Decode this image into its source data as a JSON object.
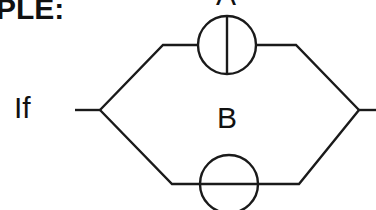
{
  "heading": {
    "text": "PLE:"
  },
  "labels": {
    "current": "If",
    "top_element": "A",
    "bottom_element": "B"
  },
  "colors": {
    "stroke": "#1a1a1a",
    "text": "#111111",
    "background": "#ffffff"
  },
  "diagram": {
    "type": "parallel-circuit",
    "branches": [
      {
        "name": "A",
        "symbol": "circle-with-vertical-line"
      },
      {
        "name": "B",
        "symbol": "circle-with-horizontal-line"
      }
    ]
  }
}
